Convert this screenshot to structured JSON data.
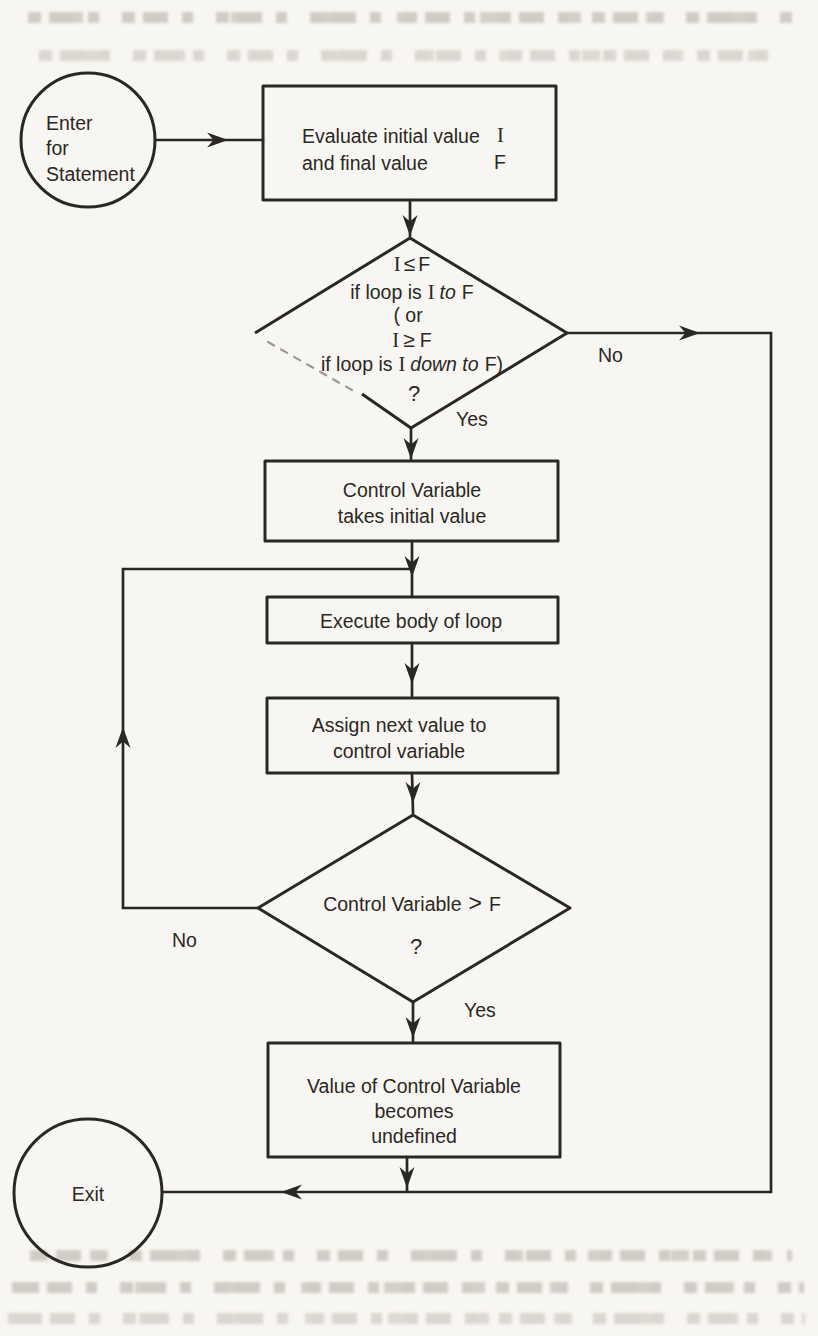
{
  "colors": {
    "ink": "#2a2823",
    "paper": "#f8f6f2"
  },
  "nodes": {
    "enter": {
      "l1": "Enter",
      "l2": "for",
      "l3": "Statement"
    },
    "evaluate": {
      "l1": "Evaluate initial value",
      "l1v": "I",
      "l2": "and final value",
      "l2v": "F"
    },
    "cond1": {
      "i1": "I",
      "op1": "≤",
      "f1": "F",
      "l2a": "if loop is",
      "l2i": "I",
      "l2b": "to",
      "l2f": "F",
      "l3": "( or",
      "i2": "I",
      "op2": "≥",
      "f2": "F",
      "l5a": "if loop is",
      "l5i": "I",
      "l5b": "down to",
      "l5f": "F)",
      "q": "?"
    },
    "init": {
      "l1": "Control Variable",
      "l2": "takes initial value"
    },
    "body": {
      "l1": "Execute body of loop"
    },
    "next": {
      "l1": "Assign next value to",
      "l2": "control variable"
    },
    "cond2": {
      "l1a": "Control Variable",
      "op": ">",
      "f": "F",
      "q": "?"
    },
    "undefined_node": {
      "l1": "Value of Control Variable",
      "l2": "becomes",
      "l3": "undefined"
    },
    "exit": {
      "l1": "Exit"
    }
  },
  "edge_labels": {
    "cond1_no": "No",
    "cond1_yes": "Yes",
    "cond2_no": "No",
    "cond2_yes": "Yes"
  }
}
